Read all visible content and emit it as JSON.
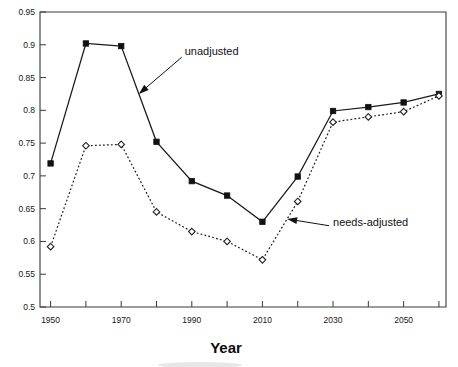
{
  "chart_data": {
    "type": "line",
    "title": "",
    "xlabel": "Year",
    "ylabel": "",
    "x": [
      1950,
      1960,
      1970,
      1980,
      1990,
      2000,
      2010,
      2020,
      2030,
      2040,
      2050,
      2060
    ],
    "xlim": [
      1947,
      2062
    ],
    "ylim": [
      0.5,
      0.95
    ],
    "grid": false,
    "legend_position": "inline-annotations",
    "xticks_major": [
      1950,
      1970,
      1990,
      2010,
      2030,
      2050
    ],
    "xtick_labels": [
      "1950",
      "1970",
      "1990",
      "2010",
      "2030",
      "2050"
    ],
    "xticks_minor": [
      1960,
      1980,
      2000,
      2020,
      2040,
      2060
    ],
    "yticks": [
      0.5,
      0.55,
      0.6,
      0.65,
      0.7,
      0.75,
      0.8,
      0.85,
      0.9,
      0.95
    ],
    "ytick_labels": [
      "0.5",
      "0.55",
      "0.6",
      "0.65",
      "0.7",
      "0.75",
      "0.8",
      "0.85",
      "0.9",
      "0.95"
    ],
    "series": [
      {
        "name": "unadjusted",
        "marker": "filled-square",
        "line_style": "solid",
        "color": "#111111",
        "values": [
          0.719,
          0.902,
          0.898,
          0.752,
          0.692,
          0.67,
          0.63,
          0.699,
          0.799,
          0.805,
          0.812,
          0.825
        ]
      },
      {
        "name": "needs-adjusted",
        "marker": "open-diamond",
        "line_style": "dotted",
        "color": "#111111",
        "values": [
          0.592,
          0.746,
          0.748,
          0.645,
          0.615,
          0.6,
          0.572,
          0.661,
          0.782,
          0.79,
          0.798,
          0.822
        ]
      }
    ],
    "annotations": [
      {
        "text": "unadjusted",
        "points_to_series": "unadjusted",
        "points_to_x": 1975,
        "label_x": 1988,
        "label_y": 0.885
      },
      {
        "text": "needs-adjusted",
        "points_to_series": "needs-adjusted",
        "points_to_x": 2017,
        "label_x": 2030,
        "label_y": 0.623
      }
    ]
  }
}
